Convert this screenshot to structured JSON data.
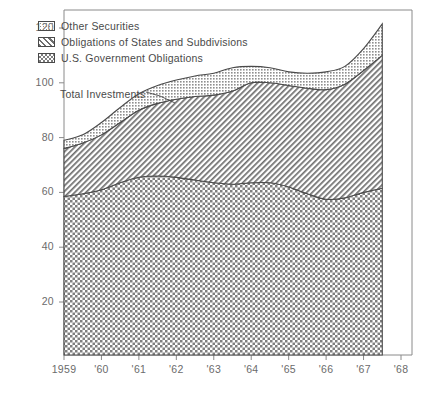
{
  "chart_data": {
    "type": "area",
    "stacked": true,
    "title": "",
    "xlabel": "",
    "ylabel": "",
    "xlim": [
      1959,
      1968
    ],
    "ylim": [
      0,
      128
    ],
    "yticks": [
      20,
      40,
      60,
      80,
      100,
      120
    ],
    "xticks": [
      1959,
      1960,
      1961,
      1962,
      1963,
      1964,
      1965,
      1966,
      1967,
      1968
    ],
    "xticklabels": [
      "1959",
      "'60",
      "'61",
      "'62",
      "'63",
      "'64",
      "'65",
      "'66",
      "'67",
      "'68"
    ],
    "grid": false,
    "legend_position": "upper-left",
    "x": [
      1959.0,
      1959.5,
      1960.0,
      1960.5,
      1961.0,
      1961.5,
      1962.0,
      1962.5,
      1963.0,
      1963.5,
      1964.0,
      1964.5,
      1965.0,
      1965.5,
      1966.0,
      1966.5,
      1967.0,
      1967.5
    ],
    "series": [
      {
        "name": "U.S. Government Obligations",
        "pattern": "checkerboard",
        "values": [
          58.5,
          59.5,
          61.0,
          63.5,
          65.5,
          66.0,
          65.5,
          64.5,
          63.5,
          63.0,
          63.5,
          63.5,
          62.0,
          59.5,
          57.5,
          58.0,
          60.0,
          61.5
        ]
      },
      {
        "name": "Obligations of States and Subdivisions",
        "pattern": "diagonal-hatch",
        "values": [
          17.5,
          18.5,
          20.0,
          22.0,
          24.5,
          26.5,
          28.5,
          30.5,
          32.0,
          34.0,
          36.5,
          36.5,
          37.0,
          38.5,
          40.0,
          41.5,
          44.5,
          48.5
        ]
      },
      {
        "name": "Other Securities",
        "pattern": "stipple",
        "values": [
          3.0,
          3.0,
          4.5,
          5.5,
          6.0,
          6.5,
          7.0,
          7.5,
          8.0,
          8.5,
          6.0,
          5.5,
          5.0,
          5.5,
          6.5,
          6.5,
          8.0,
          11.5
        ]
      }
    ],
    "totals": [
      79.0,
      81.0,
      85.5,
      91.0,
      96.0,
      99.0,
      101.0,
      102.5,
      103.5,
      105.5,
      106.0,
      105.5,
      104.0,
      103.5,
      104.0,
      106.0,
      112.5,
      121.5
    ],
    "annotations": [
      {
        "text": "Total Investments",
        "x": 1960.0,
        "y": 95.0
      }
    ]
  },
  "legend": {
    "items": [
      {
        "label": "Other Securities"
      },
      {
        "label": "Obligations of States and Subdivisions"
      },
      {
        "label": "U.S. Government Obligations"
      }
    ]
  },
  "annotation": {
    "total_investments": "Total Investments"
  },
  "axis": {
    "y_labels": [
      "120",
      "100",
      "80",
      "60",
      "40",
      "20"
    ],
    "x_labels": [
      "1959",
      "'60",
      "'61",
      "'62",
      "'63",
      "'64",
      "'65",
      "'66",
      "'67",
      "'68"
    ]
  },
  "caption": {
    "text": ""
  },
  "colors": {
    "ink": "#4a4a4a",
    "frame": "#8a8a8a",
    "stipple": "#9a9a9a",
    "hatch": "#7a7a7a",
    "check": "#8f8f8f"
  }
}
